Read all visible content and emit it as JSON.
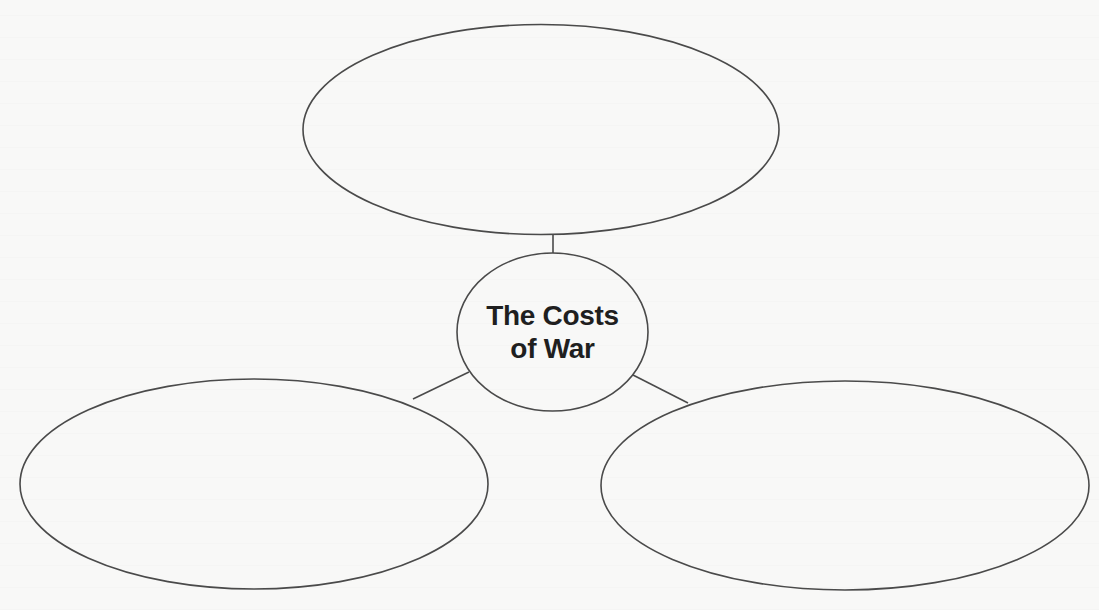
{
  "diagram": {
    "type": "web-organizer",
    "center_node": {
      "lines": [
        "The Costs",
        "of War"
      ]
    },
    "branch_nodes": [
      {
        "position": "top",
        "text": ""
      },
      {
        "position": "bottom-left",
        "text": ""
      },
      {
        "position": "bottom-right",
        "text": ""
      }
    ],
    "colors": {
      "stroke": "#4a4a4a",
      "text": "#1f1f1f",
      "background": "#f8f8f7"
    }
  }
}
